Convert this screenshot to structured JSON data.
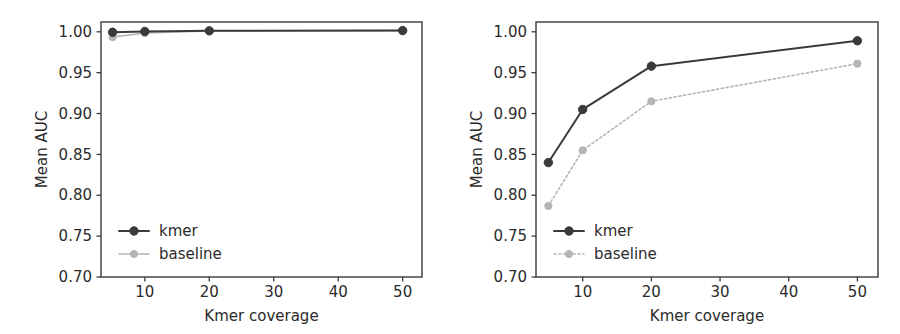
{
  "figure": {
    "background": "#ffffff",
    "panels": [
      "left",
      "right"
    ]
  },
  "colors": {
    "kmer": "#3a3a3a",
    "baseline": "#b5b5b5",
    "axis": "#3a3a3a",
    "text": "#2b2b2b"
  },
  "chart_data": [
    {
      "panel": "left",
      "type": "line",
      "title": "",
      "xlabel": "Kmer coverage",
      "ylabel": "Mean AUC",
      "x": [
        5,
        10,
        20,
        50
      ],
      "xticks": [
        10,
        20,
        30,
        40,
        50
      ],
      "xticklabels": [
        "10",
        "20",
        "30",
        "40",
        "50"
      ],
      "yticks": [
        0.7,
        0.75,
        0.8,
        0.85,
        0.9,
        0.95,
        1.0
      ],
      "yticklabels": [
        "0.70",
        "0.75",
        "0.80",
        "0.85",
        "0.90",
        "0.95",
        "1.00"
      ],
      "xlim": [
        3.2,
        53
      ],
      "ylim": [
        0.7,
        1.012
      ],
      "grid": false,
      "legend_position": "lower left",
      "series": [
        {
          "name": "kmer",
          "color": "#3a3a3a",
          "marker": "o",
          "linestyle": "solid",
          "values": [
            0.9995,
            1.0005,
            1.0012,
            1.0015
          ]
        },
        {
          "name": "baseline",
          "color": "#b5b5b5",
          "marker": "o",
          "linestyle": "solid",
          "values": [
            0.9935,
            0.9985,
            1.0012,
            1.0015
          ]
        }
      ]
    },
    {
      "panel": "right",
      "type": "line",
      "title": "",
      "xlabel": "Kmer coverage",
      "ylabel": "Mean AUC",
      "x": [
        5,
        10,
        20,
        50
      ],
      "xticks": [
        10,
        20,
        30,
        40,
        50
      ],
      "xticklabels": [
        "10",
        "20",
        "30",
        "40",
        "50"
      ],
      "yticks": [
        0.7,
        0.75,
        0.8,
        0.85,
        0.9,
        0.95,
        1.0
      ],
      "yticklabels": [
        "0.70",
        "0.75",
        "0.80",
        "0.85",
        "0.90",
        "0.95",
        "1.00"
      ],
      "xlim": [
        3.2,
        53
      ],
      "ylim": [
        0.7,
        1.012
      ],
      "grid": false,
      "legend_position": "lower left",
      "series": [
        {
          "name": "kmer",
          "color": "#3a3a3a",
          "marker": "o",
          "linestyle": "solid",
          "values": [
            0.84,
            0.905,
            0.958,
            0.989
          ]
        },
        {
          "name": "baseline",
          "color": "#b5b5b5",
          "marker": "o",
          "linestyle": "dotted",
          "values": [
            0.787,
            0.855,
            0.915,
            0.961
          ]
        }
      ]
    }
  ]
}
